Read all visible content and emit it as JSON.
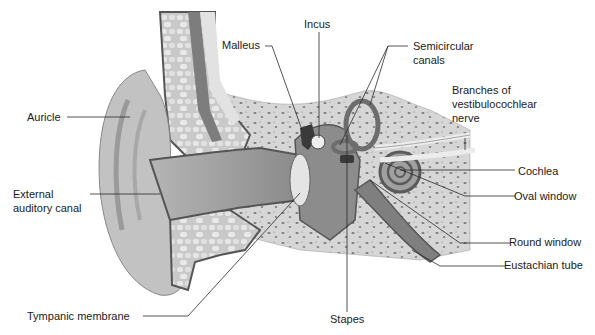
{
  "diagram": {
    "labels": {
      "auricle": "Auricle",
      "external_canal_1": "External",
      "external_canal_2": "auditory canal",
      "tympanic": "Tympanic membrane",
      "malleus": "Malleus",
      "incus": "Incus",
      "stapes": "Stapes",
      "semicircular_1": "Semicircular",
      "semicircular_2": "canals",
      "nerve_1": "Branches of",
      "nerve_2": "vestibulocochlear",
      "nerve_3": "nerve",
      "cochlea": "Cochlea",
      "oval_window": "Oval window",
      "round_window": "Round window",
      "eustachian": "Eustachian tube"
    },
    "colors": {
      "background": "#ffffff",
      "skin": "#bdbdbd",
      "skin_dark": "#8f8f8f",
      "canal": "#9a9a9a",
      "bone": "#d8d8d8",
      "bone_spots": "#7a7a7a",
      "outline": "#555555",
      "leader": "#2a2a2a"
    }
  }
}
